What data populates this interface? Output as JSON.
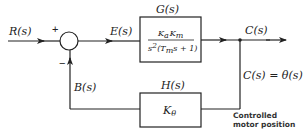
{
  "diagram": {
    "type": "feedback-control-block-diagram",
    "input_label": "R(s)",
    "error_label": "E(s)",
    "output_label": "C(s)",
    "feedback_signal_label": "B(s)",
    "output_equation": "C(s) = θ(s)",
    "summing_junction": {
      "plus_sign": "+",
      "minus_sign": "−"
    },
    "forward_block": {
      "title": "G(s)",
      "numerator": "KaKm",
      "numerator_parts": [
        "K",
        "a",
        "K",
        "m"
      ],
      "denominator_parts": [
        "s",
        "2",
        "(T",
        "m",
        "s + 1)"
      ]
    },
    "feedback_block": {
      "title": "H(s)",
      "gain_parts": [
        "K",
        "θ"
      ]
    },
    "annotation": {
      "line1": "Controlled",
      "line2": "motor position"
    },
    "colors": {
      "stroke": "#222222",
      "background": "#ffffff"
    }
  }
}
